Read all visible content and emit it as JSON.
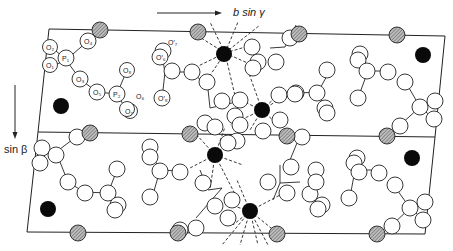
{
  "figure": {
    "type": "crystal-structure-projection",
    "axis_labels": {
      "horizontal": "b sin γ",
      "vertical": "sin β"
    },
    "atom_labels": {
      "P1": "P₁",
      "P2": "P₂",
      "O1": "O₁",
      "O2": "O₂",
      "O3": "O₃",
      "O4": "O₄",
      "O5": "O₅",
      "O6": "O₆",
      "O7": "O₇",
      "O8": "O₈",
      "O6p": "O′₆",
      "O7p": "O′₇",
      "O8p": "O′₈"
    },
    "legend_implied": {
      "open_circle": "oxygen / phosphorus",
      "hatched_circle": "cation on cell edge",
      "filled_circle": "cation"
    },
    "colors": {
      "line": "#222222",
      "filled_atom": "#0a0a0a",
      "hatched_atom": "#8a8a8a",
      "background": "#ffffff"
    }
  }
}
